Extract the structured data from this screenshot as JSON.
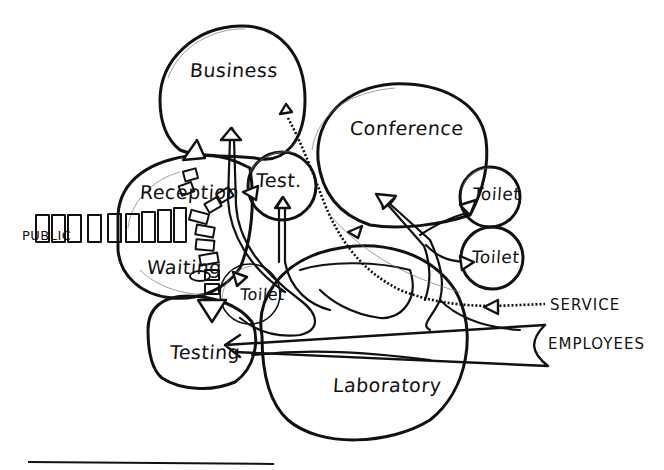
{
  "diagram": {
    "type": "bubble-diagram",
    "title": "",
    "spaces": [
      {
        "id": "business",
        "label": "Business"
      },
      {
        "id": "conference",
        "label": "Conference"
      },
      {
        "id": "reception",
        "label": "Reception"
      },
      {
        "id": "test",
        "label": "Test."
      },
      {
        "id": "toilet_upper",
        "label": "Toilet"
      },
      {
        "id": "toilet_lower",
        "label": "Toilet"
      },
      {
        "id": "waiting",
        "label": "Waiting"
      },
      {
        "id": "toilet_public",
        "label": "Toilet"
      },
      {
        "id": "testing",
        "label": "Testing"
      },
      {
        "id": "laboratory",
        "label": "Laboratory"
      }
    ],
    "entries": {
      "public": "PUBLIC",
      "service": "SERVICE",
      "employees": "EMPLOYEES"
    },
    "flows": [
      {
        "from": "public",
        "to": "reception",
        "style": "segmented"
      },
      {
        "from": "reception",
        "to": "business",
        "style": "segmented"
      },
      {
        "from": "reception",
        "to": "waiting",
        "style": "segmented"
      },
      {
        "from": "waiting",
        "to": "toilet_public",
        "style": "segmented"
      },
      {
        "from": "waiting",
        "to": "testing",
        "style": "segmented"
      },
      {
        "from": "laboratory",
        "to": "business",
        "style": "open-arrow"
      },
      {
        "from": "laboratory",
        "to": "test",
        "style": "open-arrow"
      },
      {
        "from": "laboratory",
        "to": "reception",
        "style": "open-arrow"
      },
      {
        "from": "laboratory",
        "to": "conference",
        "style": "open-arrow"
      },
      {
        "from": "laboratory",
        "to": "toilet_upper",
        "style": "open-arrow"
      },
      {
        "from": "laboratory",
        "to": "toilet_lower",
        "style": "open-arrow"
      },
      {
        "from": "employees",
        "to": "testing",
        "style": "open-arrow"
      },
      {
        "from": "service",
        "to": "business",
        "style": "hatched"
      }
    ]
  }
}
